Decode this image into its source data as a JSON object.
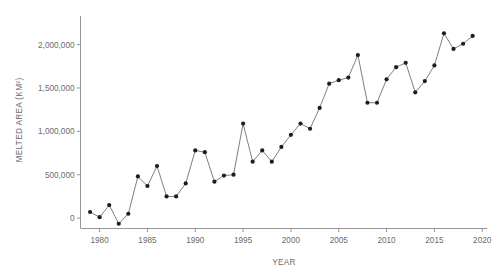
{
  "chart_data": {
    "type": "line",
    "title": "",
    "subtitle": "",
    "xlabel": "YEAR",
    "ylabel": "MELTED AREA (KM²)",
    "xlim": [
      1978,
      2020.5
    ],
    "ylim": [
      -120000,
      2330000
    ],
    "grid": false,
    "legend": null,
    "legend_position": "none",
    "marker": "filled-circle",
    "xticks": [
      1980,
      1985,
      1990,
      1995,
      2000,
      2005,
      2010,
      2015,
      2020
    ],
    "xticklabels": [
      "1980",
      "1985",
      "1990",
      "1995",
      "2000",
      "2005",
      "2010",
      "2015",
      "2020"
    ],
    "yticks": [
      0,
      500000,
      1000000,
      1500000,
      2000000
    ],
    "yticklabels": [
      "0",
      "500,000",
      "1,000,000",
      "1,500,000",
      "2,000,000"
    ],
    "series": [
      {
        "name": "Melted area",
        "color": "#1d1d22",
        "x": [
          1979,
          1980,
          1981,
          1982,
          1983,
          1984,
          1985,
          1986,
          1987,
          1988,
          1989,
          1990,
          1991,
          1992,
          1993,
          1994,
          1995,
          1996,
          1997,
          1998,
          1999,
          2000,
          2001,
          2002,
          2003,
          2004,
          2005,
          2006,
          2007,
          2008,
          2009,
          2010,
          2011,
          2012,
          2013,
          2014,
          2015,
          2016,
          2017,
          2018,
          2019
        ],
        "values": [
          70000,
          10000,
          150000,
          -65000,
          50000,
          480000,
          370000,
          600000,
          250000,
          250000,
          400000,
          780000,
          760000,
          420000,
          490000,
          500000,
          1090000,
          650000,
          780000,
          650000,
          820000,
          960000,
          1090000,
          1030000,
          1270000,
          1550000,
          1590000,
          1620000,
          1880000,
          1330000,
          1330000,
          1600000,
          1740000,
          1790000,
          1450000,
          1580000,
          1760000,
          2130000,
          1950000,
          2010000,
          2100000
        ]
      }
    ]
  },
  "axes": {
    "y_title": "MELTED AREA (KM²)",
    "x_title": "YEAR"
  }
}
